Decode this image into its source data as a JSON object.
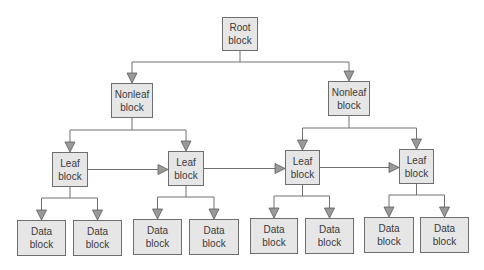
{
  "diagram": {
    "title": "",
    "style": {
      "block_fill": "#e6e6e6",
      "block_border": "#6e6e6e",
      "line_color": "#707070",
      "arrow_fill": "#9a9a9a"
    },
    "nodes": [
      {
        "id": "root",
        "line1": "Root",
        "line2": "block",
        "x": 222,
        "y": 17,
        "w": 36,
        "h": 34
      },
      {
        "id": "nonleaf-left",
        "line1": "Nonleaf",
        "line2": "block",
        "x": 111,
        "y": 83,
        "w": 42,
        "h": 35
      },
      {
        "id": "nonleaf-right",
        "line1": "Nonleaf",
        "line2": "block",
        "x": 328,
        "y": 81,
        "w": 42,
        "h": 35
      },
      {
        "id": "leaf-1",
        "line1": "Leaf",
        "line2": "block",
        "x": 52,
        "y": 152,
        "w": 36,
        "h": 35
      },
      {
        "id": "leaf-2",
        "line1": "Leaf",
        "line2": "block",
        "x": 168,
        "y": 151,
        "w": 36,
        "h": 35
      },
      {
        "id": "leaf-3",
        "line1": "Leaf",
        "line2": "block",
        "x": 285,
        "y": 150,
        "w": 35,
        "h": 35
      },
      {
        "id": "leaf-4",
        "line1": "Leaf",
        "line2": "block",
        "x": 399,
        "y": 149,
        "w": 35,
        "h": 35
      },
      {
        "id": "data-1",
        "line1": "Data",
        "line2": "block",
        "x": 17,
        "y": 220,
        "w": 49,
        "h": 36
      },
      {
        "id": "data-2",
        "line1": "Data",
        "line2": "block",
        "x": 73,
        "y": 220,
        "w": 49,
        "h": 36
      },
      {
        "id": "data-3",
        "line1": "Data",
        "line2": "block",
        "x": 133,
        "y": 219,
        "w": 49,
        "h": 36
      },
      {
        "id": "data-4",
        "line1": "Data",
        "line2": "block",
        "x": 189,
        "y": 219,
        "w": 50,
        "h": 36
      },
      {
        "id": "data-5",
        "line1": "Data",
        "line2": "block",
        "x": 250,
        "y": 218,
        "w": 48,
        "h": 36
      },
      {
        "id": "data-6",
        "line1": "Data",
        "line2": "block",
        "x": 305,
        "y": 218,
        "w": 49,
        "h": 36
      },
      {
        "id": "data-7",
        "line1": "Data",
        "line2": "block",
        "x": 364,
        "y": 217,
        "w": 50,
        "h": 36
      },
      {
        "id": "data-8",
        "line1": "Data",
        "line2": "block",
        "x": 420,
        "y": 217,
        "w": 49,
        "h": 36
      }
    ],
    "tree_edges": [
      {
        "from": "root",
        "to": [
          "nonleaf-left",
          "nonleaf-right"
        ],
        "bus_y": 62
      },
      {
        "from": "nonleaf-left",
        "to": [
          "leaf-1",
          "leaf-2"
        ],
        "bus_y": 130
      },
      {
        "from": "nonleaf-right",
        "to": [
          "leaf-3",
          "leaf-4"
        ],
        "bus_y": 128
      },
      {
        "from": "leaf-1",
        "to": [
          "data-1",
          "data-2"
        ],
        "bus_y": 198
      },
      {
        "from": "leaf-2",
        "to": [
          "data-3",
          "data-4"
        ],
        "bus_y": 197
      },
      {
        "from": "leaf-3",
        "to": [
          "data-5",
          "data-6"
        ],
        "bus_y": 196
      },
      {
        "from": "leaf-4",
        "to": [
          "data-7",
          "data-8"
        ],
        "bus_y": 195
      }
    ],
    "sibling_links": [
      {
        "from": "leaf-1",
        "to": "leaf-2"
      },
      {
        "from": "leaf-2",
        "to": "leaf-3"
      },
      {
        "from": "leaf-3",
        "to": "leaf-4"
      }
    ]
  }
}
